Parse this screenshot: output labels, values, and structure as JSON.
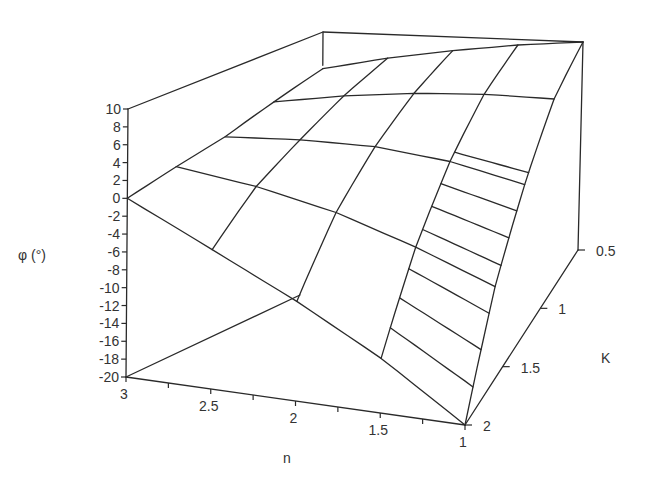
{
  "chart_data": {
    "type": "surface3d",
    "title": "",
    "xlabel": "n",
    "ylabel": "K",
    "zlabel": "φ (°)",
    "x_ticks": [
      "3",
      "2.5",
      "2",
      "1.5",
      "1"
    ],
    "x_tick_values": [
      3,
      2.5,
      2,
      1.5,
      1
    ],
    "y_ticks": [
      "0.5",
      "1",
      "1.5",
      "2"
    ],
    "y_tick_values": [
      0.5,
      1,
      1.5,
      2
    ],
    "z_ticks": [
      "10",
      "8",
      "6",
      "4",
      "2",
      "0",
      "-2",
      "-4",
      "-6",
      "-8",
      "-10",
      "-12",
      "-14",
      "-16",
      "-18",
      "-20"
    ],
    "z_tick_values": [
      10,
      8,
      6,
      4,
      2,
      0,
      -2,
      -4,
      -6,
      -8,
      -10,
      -12,
      -14,
      -16,
      -18,
      -20
    ],
    "xlim": [
      1,
      3
    ],
    "ylim": [
      0.5,
      2
    ],
    "zlim": [
      -20,
      10
    ],
    "grid_n": [
      3,
      2.5,
      2,
      1.5,
      1
    ],
    "grid_K": [
      0.5,
      0.875,
      1.25,
      1.625,
      2
    ],
    "phi": [
      [
        4.5,
        3.0,
        1.5,
        0.8,
        0.0
      ],
      [
        6.5,
        4.5,
        2.0,
        -0.5,
        -4.5
      ],
      [
        8.0,
        5.5,
        2.0,
        -2.5,
        -9.0
      ],
      [
        9.2,
        6.0,
        1.0,
        -5.5,
        -14.0
      ],
      [
        10.0,
        6.0,
        -1.0,
        -9.0,
        -20.0
      ]
    ],
    "phi_note": "rows follow grid_n, columns follow grid_K"
  }
}
